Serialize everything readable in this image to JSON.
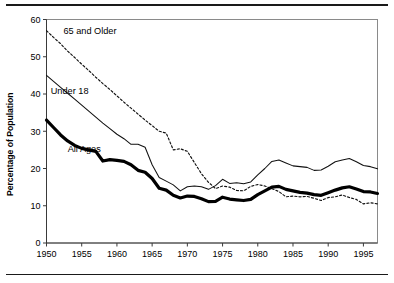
{
  "figure": {
    "top_rule": "horizontal-rule",
    "bottom_rule": "horizontal-rule"
  },
  "axes": {
    "ylabel": "Percentage of Population",
    "xlabel": "",
    "ylim": [
      0,
      60
    ],
    "xlim": [
      1950,
      1997
    ],
    "yticks": [
      0,
      10,
      20,
      30,
      40,
      50,
      60
    ],
    "ytick_labels": [
      "0",
      "10",
      "20",
      "30",
      "40",
      "50",
      "60"
    ],
    "xticks": [
      1950,
      1955,
      1960,
      1965,
      1970,
      1975,
      1980,
      1985,
      1990,
      1995
    ],
    "xtick_labels": [
      "1950",
      "1955",
      "1960",
      "1965",
      "1970",
      "1975",
      "1980",
      "1985",
      "1990",
      "1995"
    ],
    "grid": false
  },
  "annotations": [
    {
      "text": "65 and Older",
      "x": 1952.4,
      "y": 56.0
    },
    {
      "text": "Under 18",
      "x": 1950.6,
      "y": 40.0
    },
    {
      "text": "All Ages",
      "x": 1953.0,
      "y": 24.3
    }
  ],
  "colors": {
    "line": "#000000",
    "axis": "#3a3a3a",
    "border": "#8a8a8a",
    "background": "#ffffff"
  },
  "chart_data": {
    "type": "line",
    "title": "",
    "subtitle": "",
    "xlabel": "",
    "ylabel": "Percentage of Population",
    "xlim": [
      1950,
      1997
    ],
    "ylim": [
      0,
      60
    ],
    "grid": false,
    "legend_position": "inline-annotations",
    "x": [
      1950,
      1951,
      1952,
      1953,
      1954,
      1955,
      1956,
      1957,
      1958,
      1959,
      1960,
      1961,
      1962,
      1963,
      1964,
      1965,
      1966,
      1967,
      1968,
      1969,
      1970,
      1971,
      1972,
      1973,
      1974,
      1975,
      1976,
      1977,
      1978,
      1979,
      1980,
      1981,
      1982,
      1983,
      1984,
      1985,
      1986,
      1987,
      1988,
      1989,
      1990,
      1991,
      1992,
      1993,
      1994,
      1995,
      1996,
      1997
    ],
    "series": [
      {
        "name": "65 and Older",
        "style": "dotted",
        "values": [
          57.0,
          55.2,
          53.5,
          51.5,
          49.8,
          48.0,
          46.3,
          44.5,
          42.8,
          41.2,
          39.5,
          37.8,
          36.2,
          34.6,
          33.0,
          31.5,
          30.0,
          29.5,
          25.0,
          25.3,
          24.6,
          21.6,
          18.6,
          16.3,
          14.6,
          15.3,
          15.0,
          14.1,
          14.0,
          15.2,
          15.7,
          15.3,
          14.6,
          13.8,
          12.4,
          12.6,
          12.4,
          12.5,
          12.0,
          11.4,
          12.2,
          12.4,
          12.9,
          12.2,
          11.7,
          10.5,
          10.8,
          10.5
        ]
      },
      {
        "name": "Under 18",
        "style": "thin-solid",
        "values": [
          45.0,
          43.4,
          41.8,
          40.2,
          38.6,
          37.0,
          35.4,
          33.8,
          32.2,
          30.7,
          29.2,
          28.0,
          26.5,
          26.5,
          25.7,
          21.0,
          17.6,
          16.6,
          15.6,
          14.0,
          15.1,
          15.3,
          15.1,
          14.4,
          15.4,
          17.1,
          16.0,
          16.2,
          15.9,
          16.4,
          18.3,
          20.0,
          21.9,
          22.3,
          21.5,
          20.7,
          20.5,
          20.3,
          19.5,
          19.6,
          20.6,
          21.8,
          22.3,
          22.7,
          21.8,
          20.8,
          20.5,
          19.9
        ]
      },
      {
        "name": "All Ages",
        "style": "thick-solid",
        "values": [
          33.0,
          31.0,
          29.0,
          27.4,
          26.2,
          25.4,
          25.0,
          24.6,
          22.0,
          22.4,
          22.2,
          21.9,
          21.0,
          19.5,
          19.0,
          17.3,
          14.7,
          14.2,
          12.8,
          12.1,
          12.6,
          12.5,
          11.9,
          11.1,
          11.2,
          12.3,
          11.8,
          11.6,
          11.4,
          11.7,
          13.0,
          14.0,
          15.0,
          15.2,
          14.4,
          14.0,
          13.6,
          13.4,
          13.0,
          12.8,
          13.5,
          14.2,
          14.8,
          15.1,
          14.5,
          13.8,
          13.7,
          13.3
        ]
      }
    ]
  }
}
